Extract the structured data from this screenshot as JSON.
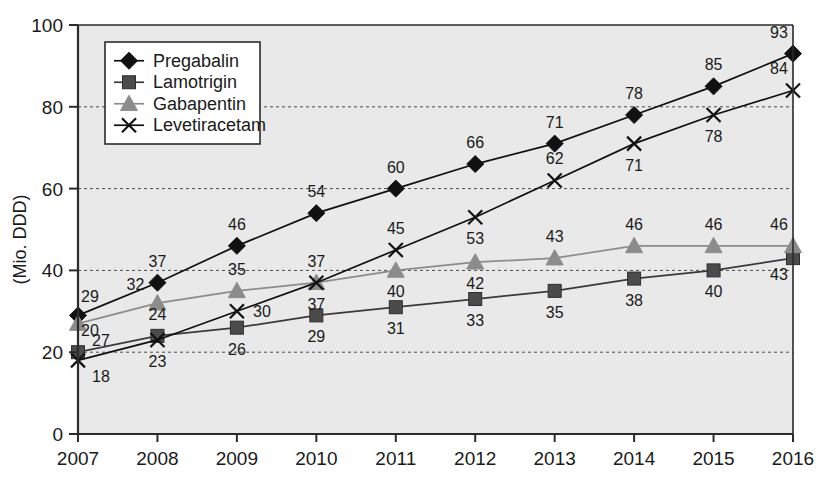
{
  "chart_data": {
    "type": "line",
    "title": "",
    "xlabel": "",
    "ylabel": "(Mio. DDD)",
    "categories": [
      "2007",
      "2008",
      "2009",
      "2010",
      "2011",
      "2012",
      "2013",
      "2014",
      "2015",
      "2016"
    ],
    "xlim": [
      2007,
      2016
    ],
    "ylim": [
      0,
      100
    ],
    "yticks": [
      0,
      20,
      40,
      60,
      80,
      100
    ],
    "ytick_labels": [
      "0",
      "20",
      "40",
      "60",
      "80",
      "100"
    ],
    "gridlines": [
      20,
      40,
      60,
      80
    ],
    "grid": true,
    "legend_position": "upper-left-inside",
    "series": [
      {
        "name": "Pregabalin",
        "marker": "diamond",
        "color": "#111111",
        "line_color": "#111111",
        "values": [
          29,
          37,
          46,
          54,
          60,
          66,
          71,
          78,
          85,
          93
        ],
        "label_positions": [
          "above-left",
          "above",
          "above",
          "above",
          "above",
          "above",
          "above",
          "above",
          "above",
          "above"
        ]
      },
      {
        "name": "Lamotrigin",
        "marker": "square",
        "color": "#4b4b4b",
        "line_color": "#3a3a3a",
        "values": [
          20,
          24,
          26,
          29,
          31,
          33,
          35,
          38,
          40,
          43
        ],
        "label_positions": [
          "above",
          "above",
          "below",
          "below",
          "below",
          "below",
          "below",
          "below",
          "below",
          "below-right"
        ]
      },
      {
        "name": "Gabapentin",
        "marker": "triangle",
        "color": "#8c8c8c",
        "line_color": "#8c8c8c",
        "values": [
          27,
          32,
          35,
          37,
          40,
          42,
          43,
          46,
          46,
          46
        ],
        "label_positions": [
          "below-right",
          "above-left",
          "above",
          "above",
          "below",
          "below",
          "above",
          "above",
          "above",
          "above"
        ]
      },
      {
        "name": "Levetiracetam",
        "marker": "cross",
        "color": "#111111",
        "line_color": "#111111",
        "values": [
          18,
          23,
          30,
          37,
          45,
          53,
          62,
          71,
          78,
          84
        ],
        "label_positions": [
          "below-right",
          "below",
          "right",
          "below",
          "above",
          "below",
          "above",
          "below",
          "below",
          "above"
        ]
      }
    ]
  },
  "layout": {
    "plot_left": 78,
    "plot_right": 793,
    "plot_top": 25,
    "plot_bottom": 434,
    "background_color": "#e9e9e9",
    "axis_color": "#2b2b2b",
    "grid_color": "#4a4a4a"
  }
}
